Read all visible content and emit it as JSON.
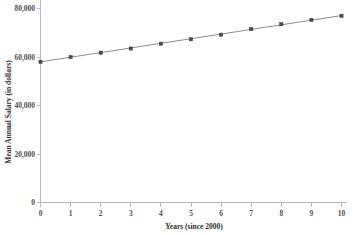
{
  "chart_data": {
    "type": "scatter",
    "title": "",
    "xlabel": "Years (since 2000)",
    "ylabel": "Mean Annual Salary (in dollars)",
    "x": [
      0,
      1,
      2,
      3,
      4,
      5,
      6,
      7,
      8,
      9,
      10
    ],
    "values": [
      58000,
      60000,
      61800,
      63500,
      65500,
      67300,
      69200,
      71500,
      73500,
      75300,
      77000
    ],
    "series": [
      {
        "name": "Mean Annual Salary",
        "values": [
          58000,
          60000,
          61800,
          63500,
          65500,
          67300,
          69200,
          71500,
          73500,
          75300,
          77000
        ]
      }
    ],
    "trend_line": {
      "name": "Linear fit",
      "start": [
        0,
        58000
      ],
      "end": [
        10,
        77100
      ]
    },
    "xlim": [
      0,
      10
    ],
    "ylim": [
      0,
      82000
    ],
    "xticks": [
      "0",
      "1",
      "2",
      "3",
      "4",
      "5",
      "6",
      "7",
      "8",
      "9",
      "10"
    ],
    "xtick_values": [
      0,
      1,
      2,
      3,
      4,
      5,
      6,
      7,
      8,
      9,
      10
    ],
    "yticks": [
      "0",
      "20,000",
      "40,000",
      "60,000",
      "80,000"
    ],
    "ytick_values": [
      0,
      20000,
      40000,
      60000,
      80000
    ],
    "grid": false,
    "legend": "none",
    "marker_color": "#4a4a4a",
    "line_color": "#8c8c8c",
    "axis_color": "#b9b9b9",
    "background_color": "#ffffff"
  }
}
